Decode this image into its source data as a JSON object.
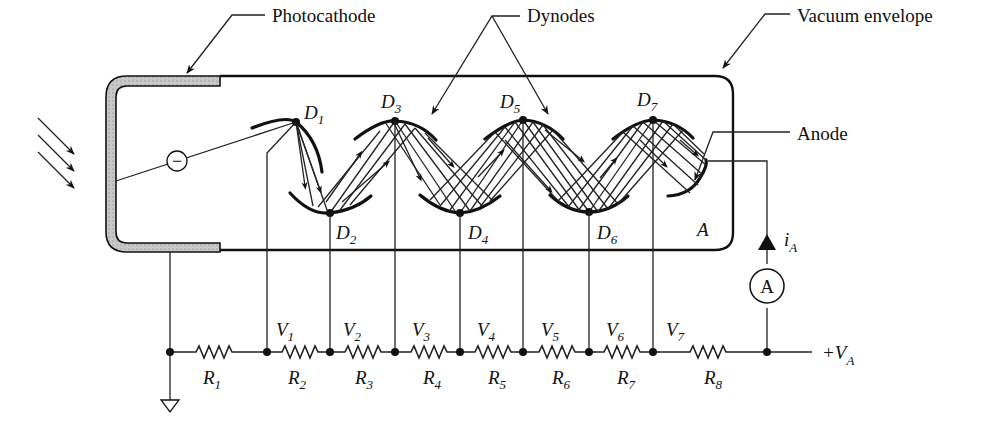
{
  "callouts": {
    "photocathode": "Photocathode",
    "dynodes": "Dynodes",
    "vacuum_envelope": "Vacuum envelope",
    "anode": "Anode"
  },
  "dynodes": [
    {
      "name": "D",
      "sub": "1"
    },
    {
      "name": "D",
      "sub": "2"
    },
    {
      "name": "D",
      "sub": "3"
    },
    {
      "name": "D",
      "sub": "4"
    },
    {
      "name": "D",
      "sub": "5"
    },
    {
      "name": "D",
      "sub": "6"
    },
    {
      "name": "D",
      "sub": "7"
    }
  ],
  "anode_label": "A",
  "electron_symbol": "−",
  "current": {
    "name": "i",
    "sub": "A"
  },
  "ammeter": "A",
  "voltages": [
    {
      "name": "V",
      "sub": "1"
    },
    {
      "name": "V",
      "sub": "2"
    },
    {
      "name": "V",
      "sub": "3"
    },
    {
      "name": "V",
      "sub": "4"
    },
    {
      "name": "V",
      "sub": "5"
    },
    {
      "name": "V",
      "sub": "6"
    },
    {
      "name": "V",
      "sub": "7"
    }
  ],
  "resistors": [
    {
      "name": "R",
      "sub": "1"
    },
    {
      "name": "R",
      "sub": "2"
    },
    {
      "name": "R",
      "sub": "3"
    },
    {
      "name": "R",
      "sub": "4"
    },
    {
      "name": "R",
      "sub": "5"
    },
    {
      "name": "R",
      "sub": "6"
    },
    {
      "name": "R",
      "sub": "7"
    },
    {
      "name": "R",
      "sub": "8"
    }
  ],
  "supply": {
    "prefix": "+V",
    "sub": "A"
  },
  "colors": {
    "line": "#111111",
    "cathode_fill": "#bdbdbd",
    "background": "#ffffff"
  }
}
